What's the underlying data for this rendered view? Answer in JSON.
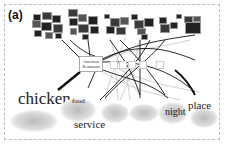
{
  "figure": {
    "panel_label": "(a)",
    "main_node": {
      "line1": "American",
      "line2": "Restaurant"
    },
    "small_nodes": [
      "",
      "",
      "",
      "",
      ""
    ],
    "word_clouds": [
      {
        "keyword": "chicken"
      },
      {
        "keyword": "food"
      },
      {
        "keyword": "service"
      },
      {
        "keyword": ""
      },
      {
        "keyword": ""
      },
      {
        "keyword": "night"
      },
      {
        "keyword": "place"
      }
    ],
    "colors": {
      "edge": "#111111",
      "edge_light": "#bbbbbb",
      "border": "#bbbbbb"
    }
  }
}
